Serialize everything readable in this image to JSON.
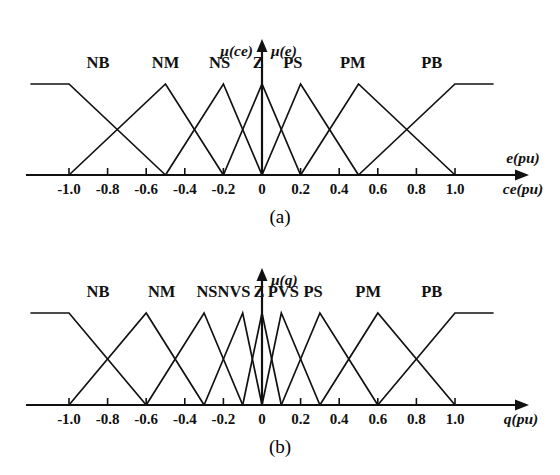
{
  "figure": {
    "background": "#ffffff",
    "line_color": "#111111"
  },
  "panels": [
    {
      "id": "a",
      "caption": "(a)",
      "y_axis_label_left": "μ(ce)",
      "y_axis_label_right": "μ(e)",
      "x_axis_label_top": "e(pu)",
      "x_axis_label_bottom": "ce(pu)",
      "tick_labels": [
        "-1.0",
        "-0.8",
        "-0.6",
        "-0.4",
        "-0.2",
        "0",
        "0.2",
        "0.4",
        "0.6",
        "0.8",
        "1.0"
      ],
      "tick_values": [
        -1.0,
        -0.8,
        -0.6,
        -0.4,
        -0.2,
        0,
        0.2,
        0.4,
        0.6,
        0.8,
        1.0
      ],
      "set_labels": [
        "NB",
        "NM",
        "NS",
        "Z",
        "PS",
        "PM",
        "PB"
      ],
      "set_label_positions": [
        -0.85,
        -0.5,
        -0.22,
        -0.02,
        0.16,
        0.47,
        0.88
      ]
    },
    {
      "id": "b",
      "caption": "(b)",
      "y_axis_label_right": "μ(q)",
      "x_axis_label_bottom": "q(pu)",
      "tick_labels": [
        "-1.0",
        "-0.8",
        "-0.6",
        "-0.4",
        "-0.2",
        "0",
        "0.2",
        "0.4",
        "0.6",
        "0.8",
        "1.0"
      ],
      "tick_values": [
        -1.0,
        -0.8,
        -0.6,
        -0.4,
        -0.2,
        0,
        0.2,
        0.4,
        0.6,
        0.8,
        1.0
      ],
      "set_labels": [
        "NB",
        "NM",
        "NS",
        "NVS",
        "Z",
        "PVS",
        "PS",
        "PM",
        "PB"
      ],
      "set_label_positions": [
        -0.85,
        -0.52,
        -0.285,
        -0.145,
        -0.015,
        0.11,
        0.265,
        0.55,
        0.88
      ]
    }
  ],
  "chart_data": [
    {
      "type": "line",
      "title": "(a) Membership functions for error e(pu) and change of error ce(pu)",
      "xlabel": "e(pu) / ce(pu)",
      "ylabel": "μ(ce)  μ(e)",
      "xlim": [
        -1.2,
        1.2
      ],
      "ylim": [
        0,
        1
      ],
      "grid": false,
      "legend": "inline-above-peaks",
      "xticks": [
        -1.0,
        -0.8,
        -0.6,
        -0.4,
        -0.2,
        0,
        0.2,
        0.4,
        0.6,
        0.8,
        1.0
      ],
      "xticklabels": [
        "-1.0",
        "-0.8",
        "-0.6",
        "-0.4",
        "-0.2",
        "0",
        "0.2",
        "0.4",
        "0.6",
        "0.8",
        "1.0"
      ],
      "series": [
        {
          "name": "NB",
          "shape": "trapezoid",
          "points": [
            [
              -1.2,
              1
            ],
            [
              -1.0,
              1
            ],
            [
              -0.5,
              0
            ]
          ]
        },
        {
          "name": "NM",
          "shape": "triangle",
          "points": [
            [
              -1.0,
              0
            ],
            [
              -0.5,
              1
            ],
            [
              -0.2,
              0
            ]
          ]
        },
        {
          "name": "NS",
          "shape": "triangle",
          "points": [
            [
              -0.5,
              0
            ],
            [
              -0.2,
              1
            ],
            [
              0,
              0
            ]
          ]
        },
        {
          "name": "Z",
          "shape": "triangle",
          "points": [
            [
              -0.2,
              0
            ],
            [
              0,
              1
            ],
            [
              0.2,
              0
            ]
          ]
        },
        {
          "name": "PS",
          "shape": "triangle",
          "points": [
            [
              0,
              0
            ],
            [
              0.2,
              1
            ],
            [
              0.5,
              0
            ]
          ]
        },
        {
          "name": "PM",
          "shape": "triangle",
          "points": [
            [
              0.2,
              0
            ],
            [
              0.5,
              1
            ],
            [
              1.0,
              0
            ]
          ]
        },
        {
          "name": "PB",
          "shape": "trapezoid",
          "points": [
            [
              0.5,
              0
            ],
            [
              1.0,
              1
            ],
            [
              1.2,
              1
            ]
          ]
        }
      ]
    },
    {
      "type": "line",
      "title": "(b) Membership functions for output q(pu)",
      "xlabel": "q(pu)",
      "ylabel": "μ(q)",
      "xlim": [
        -1.2,
        1.2
      ],
      "ylim": [
        0,
        1
      ],
      "grid": false,
      "legend": "inline-above-peaks",
      "xticks": [
        -1.0,
        -0.8,
        -0.6,
        -0.4,
        -0.2,
        0,
        0.2,
        0.4,
        0.6,
        0.8,
        1.0
      ],
      "xticklabels": [
        "-1.0",
        "-0.8",
        "-0.6",
        "-0.4",
        "-0.2",
        "0",
        "0.2",
        "0.4",
        "0.6",
        "0.8",
        "1.0"
      ],
      "series": [
        {
          "name": "NB",
          "shape": "trapezoid",
          "points": [
            [
              -1.2,
              1
            ],
            [
              -1.0,
              1
            ],
            [
              -0.6,
              0
            ]
          ]
        },
        {
          "name": "NM",
          "shape": "triangle",
          "points": [
            [
              -1.0,
              0
            ],
            [
              -0.6,
              1
            ],
            [
              -0.3,
              0
            ]
          ]
        },
        {
          "name": "NS",
          "shape": "triangle",
          "points": [
            [
              -0.6,
              0
            ],
            [
              -0.3,
              1
            ],
            [
              -0.1,
              0
            ]
          ]
        },
        {
          "name": "NVS",
          "shape": "triangle",
          "points": [
            [
              -0.3,
              0
            ],
            [
              -0.1,
              1
            ],
            [
              0,
              0
            ]
          ]
        },
        {
          "name": "Z",
          "shape": "triangle",
          "points": [
            [
              -0.1,
              0
            ],
            [
              0,
              1
            ],
            [
              0.1,
              0
            ]
          ]
        },
        {
          "name": "PVS",
          "shape": "triangle",
          "points": [
            [
              0,
              0
            ],
            [
              0.1,
              1
            ],
            [
              0.3,
              0
            ]
          ]
        },
        {
          "name": "PS",
          "shape": "triangle",
          "points": [
            [
              0.1,
              0
            ],
            [
              0.3,
              1
            ],
            [
              0.6,
              0
            ]
          ]
        },
        {
          "name": "PM",
          "shape": "triangle",
          "points": [
            [
              0.3,
              0
            ],
            [
              0.6,
              1
            ],
            [
              1.0,
              0
            ]
          ]
        },
        {
          "name": "PB",
          "shape": "trapezoid",
          "points": [
            [
              0.6,
              0
            ],
            [
              1.0,
              1
            ],
            [
              1.2,
              1
            ]
          ]
        }
      ]
    }
  ]
}
